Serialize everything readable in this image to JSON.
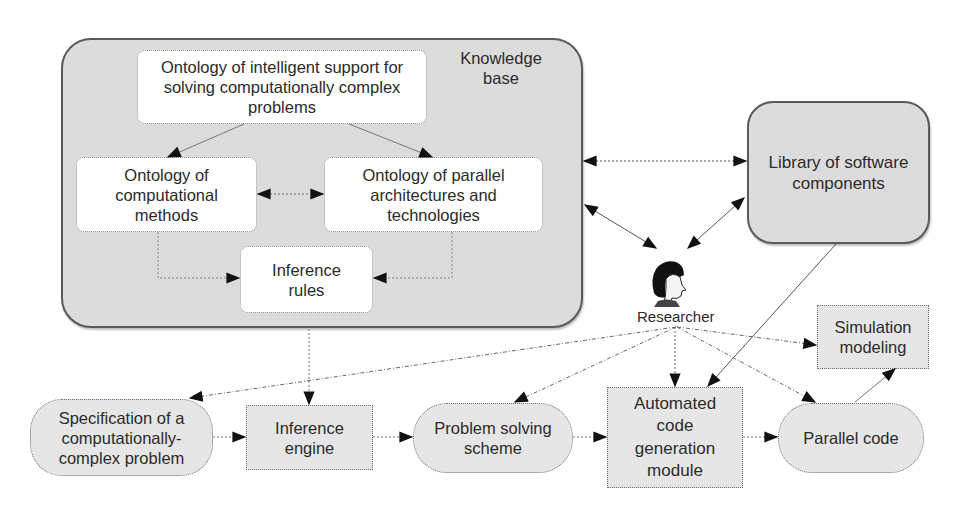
{
  "diagram": {
    "knowledge_base": {
      "label": "Knowledge base",
      "label_line1": "Knowledge",
      "label_line2": "base",
      "nodes": {
        "intelligent_support": {
          "line1": "Ontology of intelligent support for",
          "line2": "solving computationally complex",
          "line3": "problems"
        },
        "computational_methods": {
          "line1": "Ontology of",
          "line2": "computational",
          "line3": "methods"
        },
        "parallel_architectures": {
          "line1": "Ontology of parallel",
          "line2": "architectures and",
          "line3": "technologies"
        },
        "inference_rules": {
          "line1": "Inference",
          "line2": "rules"
        }
      }
    },
    "library": {
      "line1": "Library of software",
      "line2": "components"
    },
    "researcher": {
      "label": "Researcher",
      "icon": "person-head-icon"
    },
    "simulation": {
      "line1": "Simulation",
      "line2": "modeling"
    },
    "pipeline": [
      {
        "id": "specification",
        "line1": "Specification of a",
        "line2": "computationally-",
        "line3": "complex problem",
        "shape": "rounded"
      },
      {
        "id": "inference_engine",
        "line1": "Inference",
        "line2": "engine",
        "shape": "rect"
      },
      {
        "id": "problem_solving",
        "line1": "Problem solving",
        "line2": "scheme",
        "shape": "rounded"
      },
      {
        "id": "code_generation",
        "line1": "Automated",
        "line2": "code",
        "line3": "generation",
        "line4": "module",
        "shape": "rect"
      },
      {
        "id": "parallel_code",
        "line1": "Parallel code",
        "shape": "rounded"
      }
    ],
    "edges": [
      {
        "from": "intelligent_support",
        "to": "computational_methods",
        "style": "solid-thin"
      },
      {
        "from": "intelligent_support",
        "to": "parallel_architectures",
        "style": "solid-thin"
      },
      {
        "from": "computational_methods",
        "to": "parallel_architectures",
        "style": "dotted",
        "bidirectional": true
      },
      {
        "from": "computational_methods",
        "to": "inference_rules",
        "style": "dotted"
      },
      {
        "from": "parallel_architectures",
        "to": "inference_rules",
        "style": "dotted"
      },
      {
        "from": "knowledge_base",
        "to": "library",
        "style": "dotted",
        "bidirectional": true
      },
      {
        "from": "knowledge_base",
        "to": "researcher",
        "style": "solid",
        "bidirectional": true
      },
      {
        "from": "library",
        "to": "researcher",
        "style": "solid",
        "bidirectional": true
      },
      {
        "from": "library",
        "to": "code_generation",
        "style": "solid"
      },
      {
        "from": "knowledge_base",
        "to": "inference_engine",
        "style": "dotted"
      },
      {
        "from": "researcher",
        "to": "specification",
        "style": "dash-dot"
      },
      {
        "from": "researcher",
        "to": "problem_solving",
        "style": "dash-dot"
      },
      {
        "from": "researcher",
        "to": "code_generation",
        "style": "dash-dot"
      },
      {
        "from": "researcher",
        "to": "parallel_code",
        "style": "dash-dot"
      },
      {
        "from": "researcher",
        "to": "simulation",
        "style": "dash-dot"
      },
      {
        "from": "specification",
        "to": "inference_engine",
        "style": "dotted"
      },
      {
        "from": "inference_engine",
        "to": "problem_solving",
        "style": "dotted"
      },
      {
        "from": "problem_solving",
        "to": "code_generation",
        "style": "dotted"
      },
      {
        "from": "code_generation",
        "to": "parallel_code",
        "style": "dotted"
      },
      {
        "from": "parallel_code",
        "to": "simulation",
        "style": "solid"
      }
    ],
    "colors": {
      "container_fill": "#dcdcdc",
      "node_fill": "#e6e6e6",
      "inner_node_fill": "#ffffff",
      "stroke": "#5a5a5a",
      "arrow": "#1a1a1a"
    }
  }
}
